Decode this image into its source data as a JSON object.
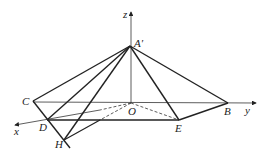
{
  "figure": {
    "type": "3d-coordinate-geometry",
    "axes": {
      "x": "x",
      "y": "y",
      "z": "z"
    },
    "points": {
      "A_prime": "A′",
      "B": "B",
      "C": "C",
      "D": "D",
      "E": "E",
      "H": "H",
      "O": "O"
    },
    "colors": {
      "line": "#222222",
      "background": "#ffffff"
    }
  }
}
